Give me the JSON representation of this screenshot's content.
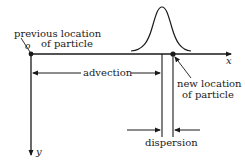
{
  "diagram": {
    "axes": {
      "x_label": "x",
      "y_label": "y",
      "origin_label": "o"
    },
    "labels": {
      "previous_location_line1": "previous location",
      "previous_location_line2": "of particle",
      "new_location_line1": "new location",
      "new_location_line2": "of particle",
      "advection": "advection",
      "dispersion": "dispersion"
    },
    "colors": {
      "ink": "#1a1a1a",
      "background": "#ffffff"
    }
  }
}
